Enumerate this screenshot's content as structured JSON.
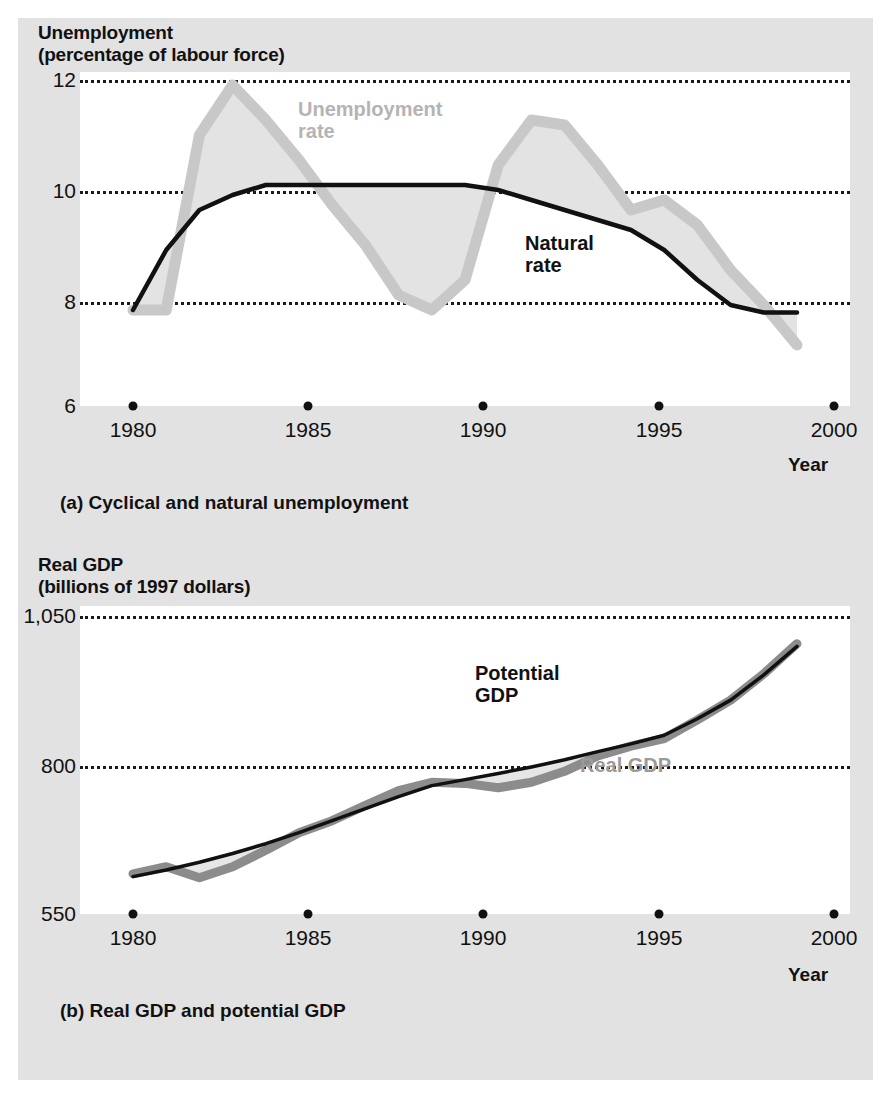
{
  "figure": {
    "panel_a": {
      "y_axis_title_line1": "Unemployment",
      "y_axis_title_line2": "(percentage of labour force)",
      "y_ticks": [
        "12",
        "10",
        "8",
        "6"
      ],
      "y_tick_values": [
        12,
        10,
        8,
        6
      ],
      "x_ticks": [
        "1980",
        "1985",
        "1990",
        "1995",
        "2000"
      ],
      "x_axis_label": "Year",
      "caption": "(a) Cyclical and natural unemployment",
      "label_unemployment_rate_line1": "Unemployment",
      "label_unemployment_rate_line2": "rate",
      "label_natural_rate_line1": "Natural",
      "label_natural_rate_line2": "rate"
    },
    "panel_b": {
      "y_axis_title_line1": "Real GDP",
      "y_axis_title_line2": "(billions of 1997 dollars)",
      "y_ticks": [
        "1,050",
        "800",
        "550"
      ],
      "y_tick_values": [
        1050,
        800,
        550
      ],
      "x_ticks": [
        "1980",
        "1985",
        "1990",
        "1995",
        "2000"
      ],
      "x_axis_label": "Year",
      "caption": "(b) Real GDP and potential GDP",
      "label_potential_gdp_line1": "Potential",
      "label_potential_gdp_line2": "GDP",
      "label_real_gdp": "Real GDP"
    }
  },
  "colors": {
    "figure_background": "#e2e2e2",
    "plot_background": "#ffffff",
    "natural_rate_line": "#111111",
    "unemployment_rate_band": "#c8c8c8",
    "unemployment_fill": "#e0e0e0",
    "real_gdp_line": "#8c8c8c",
    "potential_gdp_line": "#111111",
    "gridline": "#1a1a1a"
  },
  "chart_data": [
    {
      "type": "line",
      "id": "panel-a",
      "title": "Cyclical and natural unemployment",
      "xlabel": "Year",
      "ylabel": "Unemployment (percentage of labour force)",
      "xlim": [
        1980,
        2000
      ],
      "ylim": [
        6,
        12
      ],
      "grid": true,
      "gridlines_y": [
        12,
        10,
        8,
        6
      ],
      "legend": "inline-annotations",
      "x": [
        1980,
        1981,
        1982,
        1983,
        1984,
        1985,
        1986,
        1987,
        1988,
        1989,
        1990,
        1991,
        1992,
        1993,
        1994,
        1995,
        1996,
        1997,
        1998,
        1999,
        2000
      ],
      "series": [
        {
          "name": "Unemployment rate",
          "color": "#c8c8c8",
          "values": [
            7.5,
            7.5,
            11.0,
            12.0,
            11.3,
            10.5,
            9.6,
            8.8,
            7.8,
            7.5,
            8.1,
            10.4,
            11.3,
            11.2,
            10.4,
            9.5,
            9.7,
            9.2,
            8.3,
            7.6,
            6.8
          ]
        },
        {
          "name": "Natural rate",
          "color": "#111111",
          "values": [
            7.5,
            8.7,
            9.5,
            9.8,
            10.0,
            10.0,
            10.0,
            10.0,
            10.0,
            10.0,
            10.0,
            9.9,
            9.7,
            9.5,
            9.3,
            9.1,
            8.7,
            8.1,
            7.6,
            7.45,
            7.45
          ]
        }
      ]
    },
    {
      "type": "line",
      "id": "panel-b",
      "title": "Real GDP and potential GDP",
      "xlabel": "Year",
      "ylabel": "Real GDP (billions of 1997 dollars)",
      "xlim": [
        1980,
        2000
      ],
      "ylim": [
        550,
        1050
      ],
      "grid": true,
      "gridlines_y": [
        1050,
        800,
        550
      ],
      "legend": "inline-annotations",
      "x": [
        1980,
        1981,
        1982,
        1983,
        1984,
        1985,
        1986,
        1987,
        1988,
        1989,
        1990,
        1991,
        1992,
        1993,
        1994,
        1995,
        1996,
        1997,
        1998,
        1999,
        2000
      ],
      "series": [
        {
          "name": "Real GDP",
          "color": "#8c8c8c",
          "values": [
            585,
            598,
            578,
            598,
            628,
            660,
            682,
            710,
            737,
            752,
            750,
            742,
            752,
            772,
            800,
            818,
            832,
            866,
            902,
            950,
            1005
          ]
        },
        {
          "name": "Potential GDP",
          "color": "#111111",
          "values": [
            580,
            592,
            606,
            622,
            640,
            660,
            682,
            704,
            726,
            746,
            757,
            768,
            780,
            793,
            808,
            822,
            838,
            868,
            902,
            948,
            1000
          ]
        }
      ]
    }
  ]
}
